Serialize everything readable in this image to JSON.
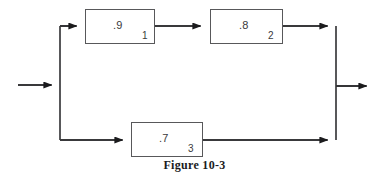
{
  "figure": {
    "caption": "Figure 10-3",
    "type": "reliability-block-diagram",
    "stroke_color": "#58585a",
    "text_color": "#3a3a3c",
    "background_color": "#ffffff"
  },
  "blocks": [
    {
      "id": "block-1",
      "gain": ".9",
      "index": "1",
      "x": 85,
      "y": 9,
      "width": 70,
      "height": 35,
      "path": "upper"
    },
    {
      "id": "block-2",
      "gain": ".8",
      "index": "2",
      "x": 210,
      "y": 9,
      "width": 73,
      "height": 35,
      "path": "upper"
    },
    {
      "id": "block-3",
      "gain": ".7",
      "index": "3",
      "x": 131,
      "y": 122,
      "width": 72,
      "height": 35,
      "path": "lower"
    }
  ],
  "connections": [
    {
      "id": "input-arrow",
      "label": "system input",
      "from": "input",
      "to": "split-node"
    },
    {
      "id": "split-to-block-1",
      "label": "split node to block 1",
      "from": "split-node",
      "to": "block-1"
    },
    {
      "id": "block-1-to-block-2",
      "label": "block 1 to block 2",
      "from": "block-1",
      "to": "block-2"
    },
    {
      "id": "block-2-to-join",
      "label": "block 2 to join node",
      "from": "block-2",
      "to": "join-node"
    },
    {
      "id": "split-to-block-3",
      "label": "split node to block 3",
      "from": "split-node",
      "to": "block-3"
    },
    {
      "id": "block-3-to-join",
      "label": "block 3 to join node",
      "from": "block-3",
      "to": "join-node"
    },
    {
      "id": "output-arrow",
      "label": "system output",
      "from": "join-node",
      "to": "output"
    }
  ],
  "nodes": {
    "split": {
      "x": 60,
      "y_top": 26,
      "y_bottom": 140,
      "y_input": 85
    },
    "join": {
      "x": 336,
      "y_top": 26,
      "y_bottom": 140,
      "y_output": 86
    }
  }
}
